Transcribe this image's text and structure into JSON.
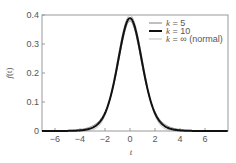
{
  "chart_data": {
    "type": "line",
    "title": "",
    "xlabel": "t",
    "ylabel": "f(t)",
    "xlim": [
      -7.04,
      7.84
    ],
    "ylim": [
      0,
      0.4
    ],
    "xticks": [
      -6,
      -4,
      -2,
      0,
      2,
      4,
      6
    ],
    "xtick_labels": [
      "−6",
      "−4",
      "−2",
      "0",
      "2",
      "4",
      "6"
    ],
    "yticks": [
      0,
      0.1,
      0.2,
      0.3,
      0.4
    ],
    "ytick_labels": [
      "0",
      "0.1",
      "0.2",
      "0.3",
      "0.4"
    ],
    "grid": false,
    "legend_position": "upper right",
    "series": [
      {
        "name": "k = 5",
        "k": 5,
        "color": "#808080",
        "line_width": 1,
        "description": "Student t density, 5 degrees of freedom",
        "x": [
          -7,
          -6,
          -5,
          -4,
          -3,
          -2,
          -1,
          0,
          1,
          2,
          3,
          4,
          5,
          6,
          7
        ],
        "values": [
          0.0009,
          0.0018,
          0.0018,
          0.0051,
          0.0173,
          0.0651,
          0.2197,
          0.3796,
          0.2197,
          0.0651,
          0.0173,
          0.0051,
          0.0018,
          0.0018,
          0.0009
        ]
      },
      {
        "name": "k = 10",
        "k": 10,
        "color": "#111111",
        "line_width": 2,
        "description": "Student t density, 10 degrees of freedom",
        "x": [
          -7,
          -6,
          -5,
          -4,
          -3,
          -2,
          -1,
          0,
          1,
          2,
          3,
          4,
          5,
          6,
          7
        ],
        "values": [
          0.0001,
          0.0003,
          0.0008,
          0.0028,
          0.0114,
          0.0611,
          0.2304,
          0.3891,
          0.2304,
          0.0611,
          0.0114,
          0.0028,
          0.0008,
          0.0003,
          0.0001
        ]
      },
      {
        "name": "k = ∞ (normal)",
        "k": "∞",
        "color": "#bdbdbd",
        "line_width": 1,
        "description": "Standard normal density",
        "x": [
          -7,
          -6,
          -5,
          -4,
          -3,
          -2,
          -1,
          0,
          1,
          2,
          3,
          4,
          5,
          6,
          7
        ],
        "values": [
          0.0,
          0.0,
          0.0,
          0.0001,
          0.0044,
          0.054,
          0.242,
          0.3989,
          0.242,
          0.054,
          0.0044,
          0.0001,
          0.0,
          0.0,
          0.0
        ]
      }
    ]
  },
  "legend": {
    "items": [
      {
        "k_symbol": "k",
        "rest": " = 5"
      },
      {
        "k_symbol": "k",
        "rest": " = 10"
      },
      {
        "k_symbol": "k",
        "rest": " = ∞ (normal)"
      }
    ]
  },
  "axes": {
    "xlabel": "t",
    "ylabel_f": "f",
    "ylabel_arg": "(t)"
  }
}
